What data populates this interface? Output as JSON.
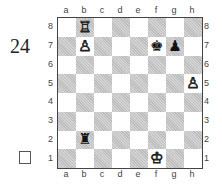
{
  "diagram": {
    "number": "24",
    "checkbox_checked": false,
    "files": [
      "a",
      "b",
      "c",
      "d",
      "e",
      "f",
      "g",
      "h"
    ],
    "ranks": [
      "8",
      "7",
      "6",
      "5",
      "4",
      "3",
      "2",
      "1"
    ],
    "pieces": [
      {
        "square": "b8",
        "color": "white",
        "type": "rook",
        "glyph": "♖"
      },
      {
        "square": "b7",
        "color": "white",
        "type": "pawn",
        "glyph": "♙"
      },
      {
        "square": "h5",
        "color": "white",
        "type": "pawn",
        "glyph": "♙"
      },
      {
        "square": "f1",
        "color": "white",
        "type": "king",
        "glyph": "♔"
      },
      {
        "square": "f7",
        "color": "black",
        "type": "king",
        "glyph": "♚"
      },
      {
        "square": "g7",
        "color": "black",
        "type": "pawn",
        "glyph": "♟"
      },
      {
        "square": "b2",
        "color": "black",
        "type": "rook",
        "glyph": "♜"
      }
    ],
    "colors": {
      "light_square": "#ffffff",
      "dark_square": "#bdbdbd",
      "border": "#444444"
    }
  }
}
